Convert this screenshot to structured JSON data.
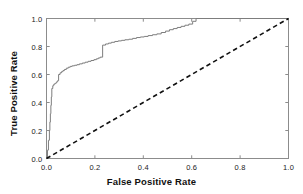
{
  "figure": {
    "background_color": "#ffffff",
    "frame_color": "#8c8c8c"
  },
  "axes": {
    "x_title": "False Positive Rate",
    "y_title": "True Positive Rate",
    "x_ticks": [
      "0.0",
      "0.2",
      "0.4",
      "0.6",
      "0.8",
      "1.0"
    ],
    "y_ticks": [
      "0.0",
      "0.2",
      "0.4",
      "0.6",
      "0.8",
      "1.0"
    ]
  },
  "chart_data": {
    "type": "line",
    "title": "",
    "xlabel": "False Positive Rate",
    "ylabel": "True Positive Rate",
    "xlim": [
      0.0,
      1.0
    ],
    "ylim": [
      0.0,
      1.0
    ],
    "xticks": [
      0.0,
      0.2,
      0.4,
      0.6,
      0.8,
      1.0
    ],
    "yticks": [
      0.0,
      0.2,
      0.4,
      0.6,
      0.8,
      1.0
    ],
    "grid": false,
    "legend": false,
    "series": [
      {
        "name": "ROC curve",
        "style": "solid-step",
        "color": "#7d7d7d",
        "linewidth": 1.0,
        "x": [
          0.0,
          0.004,
          0.008,
          0.012,
          0.014,
          0.016,
          0.018,
          0.02,
          0.022,
          0.026,
          0.03,
          0.034,
          0.038,
          0.042,
          0.046,
          0.05,
          0.056,
          0.062,
          0.068,
          0.074,
          0.082,
          0.09,
          0.098,
          0.106,
          0.116,
          0.126,
          0.136,
          0.148,
          0.16,
          0.172,
          0.184,
          0.196,
          0.206,
          0.214,
          0.222,
          0.232,
          0.244,
          0.256,
          0.268,
          0.282,
          0.296,
          0.31,
          0.324,
          0.34,
          0.356,
          0.372,
          0.388,
          0.404,
          0.42,
          0.438,
          0.456,
          0.474,
          0.492,
          0.508,
          0.524,
          0.54,
          0.556,
          0.572,
          0.588,
          0.604,
          0.618,
          0.63,
          1.0
        ],
        "y": [
          0.0,
          0.06,
          0.13,
          0.2,
          0.26,
          0.32,
          0.38,
          0.44,
          0.5,
          0.52,
          0.53,
          0.535,
          0.54,
          0.548,
          0.556,
          0.6,
          0.612,
          0.62,
          0.628,
          0.636,
          0.645,
          0.652,
          0.658,
          0.662,
          0.666,
          0.67,
          0.676,
          0.682,
          0.688,
          0.694,
          0.7,
          0.706,
          0.712,
          0.718,
          0.724,
          0.81,
          0.818,
          0.824,
          0.83,
          0.836,
          0.84,
          0.844,
          0.848,
          0.852,
          0.858,
          0.864,
          0.868,
          0.872,
          0.878,
          0.884,
          0.89,
          0.9,
          0.91,
          0.92,
          0.928,
          0.936,
          0.944,
          0.952,
          0.96,
          0.98,
          1.0,
          1.0,
          1.0
        ]
      },
      {
        "name": "Chance line",
        "style": "dashed",
        "color": "#111111",
        "linewidth": 1.6,
        "x": [
          0.0,
          1.0
        ],
        "y": [
          0.0,
          1.0
        ]
      }
    ]
  }
}
